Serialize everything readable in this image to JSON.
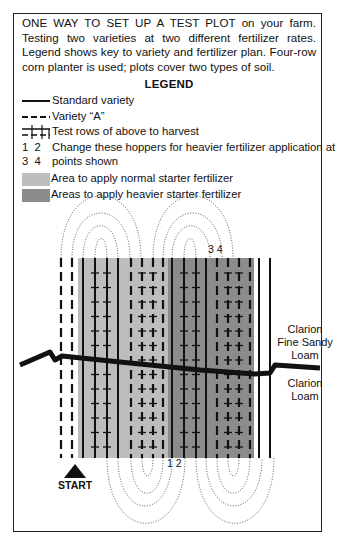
{
  "caption": {
    "lead": "ONE WAY TO SET UP A TEST PLOT",
    "text": " on your farm. Testing two varieties at two different fertilizer rates. Legend shows key to variety and fertilizer plan. Four-row corn planter is used; plots cover two types of soil."
  },
  "legend": {
    "title": "LEGEND",
    "items": [
      {
        "symbol": "solid-line",
        "label": "Standard variety"
      },
      {
        "symbol": "dashed-line",
        "label": "Variety “A”"
      },
      {
        "symbol": "crossed-lines",
        "label": "Test rows of above to harvest"
      },
      {
        "symbol_line1": "1  2",
        "symbol_line2": "3  4",
        "label_line1": "Change these hoppers for heavier fertilizer application at",
        "label_line2": "points shown"
      },
      {
        "symbol": "light-gray-swatch",
        "label": "Area to apply normal starter fertilizer",
        "color": "#bdbdbd"
      },
      {
        "symbol": "dark-gray-swatch",
        "label": "Areas to apply heavier starter fertilizer",
        "color": "#8c8c8c"
      }
    ]
  },
  "diagram": {
    "hopper_label_top": "3 4",
    "hopper_label_bottom": "1 2",
    "start_label": "START",
    "soil_upper": [
      "Clarion",
      "Fine Sandy",
      "Loam"
    ],
    "soil_lower": [
      "Clarion",
      "Loam"
    ],
    "colors": {
      "normal_area": "#bdbdbd",
      "heavy_area": "#8c8c8c",
      "line": "#111111"
    },
    "rows": [
      {
        "x": 61,
        "type": "dashed",
        "test": false
      },
      {
        "x": 72,
        "type": "dashed",
        "test": false
      },
      {
        "x": 83,
        "type": "solid",
        "test": false
      },
      {
        "x": 95,
        "type": "solid",
        "test": true
      },
      {
        "x": 107,
        "type": "solid",
        "test": true
      },
      {
        "x": 118,
        "type": "solid",
        "test": false
      },
      {
        "x": 131,
        "type": "dashed",
        "test": false
      },
      {
        "x": 142,
        "type": "dashed",
        "test": true
      },
      {
        "x": 153,
        "type": "dashed",
        "test": true
      },
      {
        "x": 163,
        "type": "dashed",
        "test": false
      },
      {
        "x": 172,
        "type": "solid",
        "test": false
      },
      {
        "x": 184,
        "type": "solid",
        "test": true
      },
      {
        "x": 196,
        "type": "solid",
        "test": true
      },
      {
        "x": 206,
        "type": "solid",
        "test": false
      },
      {
        "x": 217,
        "type": "dashed",
        "test": false
      },
      {
        "x": 228,
        "type": "dashed",
        "test": true
      },
      {
        "x": 239,
        "type": "dashed",
        "test": true
      },
      {
        "x": 250,
        "type": "dashed",
        "test": false
      },
      {
        "x": 259,
        "type": "solid",
        "test": false
      },
      {
        "x": 270,
        "type": "solid",
        "test": false
      }
    ]
  }
}
